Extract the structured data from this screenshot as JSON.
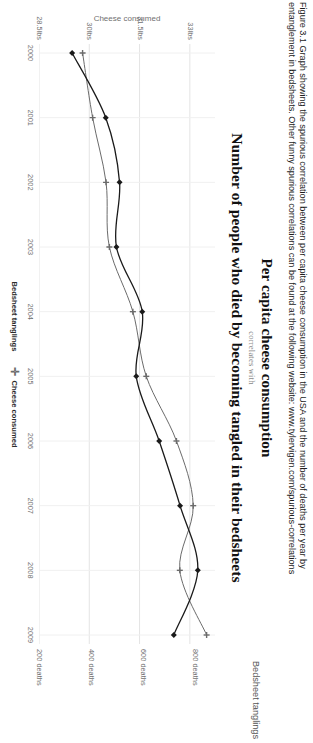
{
  "caption": {
    "label": "Figure 3.1",
    "line1": "Figure 3.1  Graph showing the spurious correlation between per capita cheese consumption in the USA and the number of deaths per year by",
    "line2": "entanglement in bedsheets. Other funny spurious correlations can be found at the following website: www.tylervigen.com/spurious-correlations"
  },
  "figure": {
    "title_top": "Per capita cheese consumption",
    "subtitle": "correlates with",
    "title_bottom": "Number of people who died by becoming tangled in their bedsheets"
  },
  "legend": {
    "items": [
      {
        "label": "Bedsheet tanglings",
        "marker": "diamond-marker",
        "color": "#1a1a1a"
      },
      {
        "label": "Cheese consumed",
        "marker": "plus-marker",
        "color": "#6b6b6b"
      }
    ]
  },
  "axes": {
    "left_title": "Cheese consumed",
    "right_title": "Bedsheet tanglings",
    "left_ticks": [
      "33lbs",
      "31.5lbs",
      "30lbs",
      "28.5lbs"
    ],
    "left_tick_values": [
      33,
      31.5,
      30,
      28.5
    ],
    "right_ticks": [
      "800 deaths",
      "600 deaths",
      "400 deaths",
      "200 deaths"
    ],
    "right_tick_values": [
      800,
      600,
      400,
      200
    ],
    "x_ticks": [
      "2000",
      "2001",
      "2002",
      "2003",
      "2004",
      "2005",
      "2006",
      "2007",
      "2008",
      "2009"
    ]
  },
  "chart_data": {
    "type": "line",
    "title": "Per capita cheese consumption correlates with Number of people who died by becoming tangled in their bedsheets",
    "subtitle": "correlates with",
    "xlabel": "",
    "ylabel": "Cheese consumed",
    "y2label": "Bedsheet tanglings",
    "grid": true,
    "legend_position": "bottom",
    "x": [
      2000,
      2001,
      2002,
      2003,
      2004,
      2005,
      2006,
      2007,
      2008,
      2009
    ],
    "xlim": [
      2000,
      2009
    ],
    "ylim": [
      28.5,
      33.75
    ],
    "y2lim": [
      200,
      875
    ],
    "series": [
      {
        "name": "Cheese consumed",
        "axis": "left",
        "units": "lbs",
        "marker": "plus-marker",
        "color": "#6b6b6b",
        "values": [
          29.8,
          30.1,
          30.5,
          30.6,
          31.3,
          31.7,
          32.6,
          33.1,
          32.7,
          33.5
        ]
      },
      {
        "name": "Bedsheet tanglings",
        "axis": "right",
        "units": "deaths",
        "marker": "diamond-marker",
        "color": "#1a1a1a",
        "values": [
          327,
          456,
          509,
          497,
          596,
          573,
          661,
          741,
          809,
          717
        ]
      }
    ]
  }
}
